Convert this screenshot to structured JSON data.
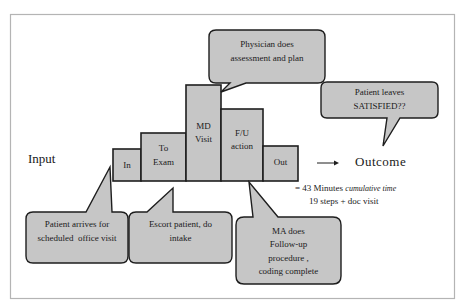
{
  "colors": {
    "fill": "#c6c6c6",
    "stroke": "#1e1e1e",
    "frame": "#b4b4b4",
    "text": "#1a1a1a"
  },
  "input_label": "Input",
  "outcome_label": "Outcome",
  "steps": [
    {
      "label_1": "In",
      "label_2": ""
    },
    {
      "label_1": "To",
      "label_2": "Exam"
    },
    {
      "label_1": "MD",
      "label_2": "Visit"
    },
    {
      "label_1": "F/U",
      "label_2": "action"
    },
    {
      "label_1": "Out",
      "label_2": ""
    }
  ],
  "callouts": {
    "physician": {
      "line_1": "Physician does",
      "line_2": "assessment and plan"
    },
    "satisfied": {
      "line_1": "Patient leaves",
      "line_2": "SATISFIED??"
    },
    "arrives": {
      "line_1": "Patient arrives for",
      "line_2": "scheduled  office visit"
    },
    "escort": {
      "line_1": "Escort patient, do",
      "line_2": "intake"
    },
    "ma": {
      "line_1": "MA does",
      "line_2": "Follow-up",
      "line_3": "procedure ,",
      "line_4": "coding complete"
    }
  },
  "summary": {
    "line_1_prefix": "= 43  Minutes",
    "line_1_italic": "cumulative time",
    "line_2": "19 steps + doc visit"
  }
}
